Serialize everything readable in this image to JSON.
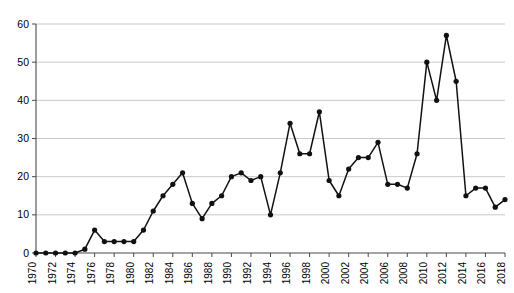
{
  "chart_data": {
    "type": "line",
    "title": "",
    "subtitle": "",
    "xlabel": "",
    "ylabel": "",
    "xlim": [
      1970,
      2018
    ],
    "ylim": [
      0,
      60
    ],
    "ytick_labels": [
      "0",
      "10",
      "20",
      "30",
      "40",
      "50",
      "60"
    ],
    "ytick_values": [
      0,
      10,
      20,
      30,
      40,
      50,
      60
    ],
    "xtick_labels": [
      "1970",
      "1972",
      "1974",
      "1976",
      "1978",
      "1980",
      "1982",
      "1984",
      "1986",
      "1988",
      "1990",
      "1992",
      "1994",
      "1996",
      "1998",
      "2000",
      "2002",
      "2004",
      "2006",
      "2008",
      "2010",
      "2012",
      "2014",
      "2016",
      "2018"
    ],
    "xtick_values": [
      1970,
      1972,
      1974,
      1976,
      1978,
      1980,
      1982,
      1984,
      1986,
      1988,
      1990,
      1992,
      1994,
      1996,
      1998,
      2000,
      2002,
      2004,
      2006,
      2008,
      2010,
      2012,
      2014,
      2016,
      2018
    ],
    "xtick_label_rotation": -90,
    "grid": "horizontal",
    "legend": "none",
    "marker": "filled-circle",
    "line_color": "#111111",
    "marker_color": "#111111",
    "grid_color": "#c9c9c9",
    "axis_color": "#4a4a4a",
    "x": [
      1970,
      1971,
      1972,
      1973,
      1974,
      1975,
      1976,
      1977,
      1978,
      1979,
      1980,
      1981,
      1982,
      1983,
      1984,
      1985,
      1986,
      1987,
      1988,
      1989,
      1990,
      1991,
      1992,
      1993,
      1994,
      1995,
      1996,
      1997,
      1998,
      1999,
      2000,
      2001,
      2002,
      2003,
      2004,
      2005,
      2006,
      2007,
      2008,
      2009,
      2010,
      2011,
      2012,
      2013,
      2014,
      2015,
      2016,
      2017,
      2018
    ],
    "values": [
      0,
      0,
      0,
      0,
      0,
      1,
      6,
      3,
      3,
      3,
      3,
      6,
      11,
      15,
      18,
      21,
      13,
      9,
      13,
      15,
      20,
      21,
      19,
      20,
      10,
      21,
      34,
      26,
      26,
      37,
      19,
      15,
      22,
      25,
      25,
      29,
      18,
      18,
      17,
      26,
      50,
      40,
      57,
      45,
      15,
      17,
      17,
      12,
      14
    ],
    "series": [
      {
        "name": "series-1",
        "values": [
          0,
          0,
          0,
          0,
          0,
          1,
          6,
          3,
          3,
          3,
          3,
          6,
          11,
          15,
          18,
          21,
          13,
          9,
          13,
          15,
          20,
          21,
          19,
          20,
          10,
          21,
          34,
          26,
          26,
          37,
          19,
          15,
          22,
          25,
          25,
          29,
          18,
          18,
          17,
          26,
          50,
          40,
          57,
          45,
          15,
          17,
          17,
          12,
          14
        ]
      }
    ]
  }
}
